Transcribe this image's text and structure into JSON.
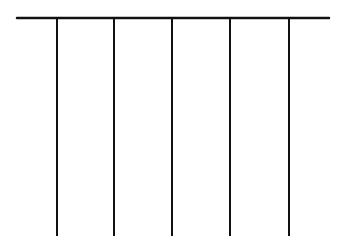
{
  "diagram": {
    "stroke_color": "#111111",
    "background": "#ffffff",
    "top_bar": {
      "x1": 17,
      "y": 18,
      "x2": 329,
      "stroke_width": 2.5
    },
    "legs": [
      {
        "x": 57,
        "y1": 18,
        "y2": 236
      },
      {
        "x": 114,
        "y1": 18,
        "y2": 236
      },
      {
        "x": 172,
        "y1": 18,
        "y2": 236
      },
      {
        "x": 230,
        "y1": 18,
        "y2": 236
      },
      {
        "x": 289,
        "y1": 18,
        "y2": 236
      }
    ],
    "leg_stroke_width": 2
  }
}
